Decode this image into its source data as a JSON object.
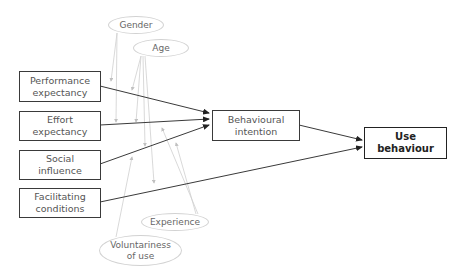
{
  "diagram": {
    "type": "UTAUT model",
    "constructs": [
      {
        "id": "performance",
        "label": "Performance\nexpectancy"
      },
      {
        "id": "effort",
        "label": "Effort\nexpectancy"
      },
      {
        "id": "social",
        "label": "Social\ninfluence"
      },
      {
        "id": "facilitating",
        "label": "Facilitating\nconditions"
      },
      {
        "id": "intention",
        "label": "Behavioural\nintention"
      },
      {
        "id": "use",
        "label": "Use\nbehaviour"
      }
    ],
    "moderators": [
      {
        "id": "gender",
        "label": "Gender"
      },
      {
        "id": "age",
        "label": "Age"
      },
      {
        "id": "experience",
        "label": "Experience"
      },
      {
        "id": "voluntariness",
        "label": "Voluntariness\nof use"
      }
    ],
    "edges": [
      {
        "from": "performance",
        "to": "intention"
      },
      {
        "from": "effort",
        "to": "intention"
      },
      {
        "from": "social",
        "to": "intention"
      },
      {
        "from": "facilitating",
        "to": "use"
      },
      {
        "from": "intention",
        "to": "use"
      }
    ],
    "colors": {
      "main_line": "#3a3a3a",
      "moderator_line": "#c8c8c8"
    }
  }
}
